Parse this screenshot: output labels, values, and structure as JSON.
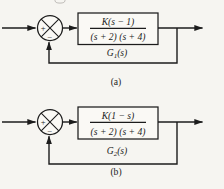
{
  "figure": {
    "colors": {
      "paper": "#f6f5f1",
      "ink": "#1c1c1c"
    },
    "diagrams": [
      {
        "caption": "(a)",
        "summing": {
          "plus": "+",
          "minus": "−"
        },
        "block": {
          "numerator": "K(s − 1)",
          "denominator": "(s + 2) (s + 4)"
        },
        "gain_label": {
          "symbol": "G",
          "subscript": "1",
          "arg": "(s)"
        }
      },
      {
        "caption": "(b)",
        "summing": {
          "plus": "+",
          "minus": "−"
        },
        "block": {
          "numerator": "K(1 − s)",
          "denominator": "(s + 2) (s + 4)"
        },
        "gain_label": {
          "symbol": "G",
          "subscript": "2",
          "arg": "(s)"
        }
      }
    ]
  }
}
